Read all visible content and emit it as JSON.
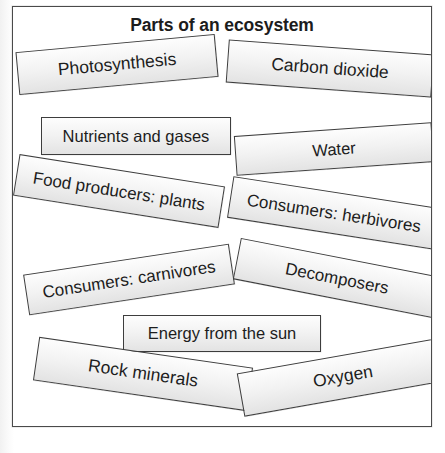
{
  "diagram": {
    "title": "Parts of an ecosystem",
    "type": "word-card-collage",
    "frame_border_color": "#4a4a4a",
    "card_fill_color": "#f0f0f0",
    "card_border_color": "#3d3d3d",
    "text_color": "#1d1d1d",
    "cards": [
      {
        "id": "photosynthesis",
        "label": "Photosynthesis",
        "rotation_deg": -5.2,
        "row": 1,
        "side": "left"
      },
      {
        "id": "carbon-dioxide",
        "label": "Carbon dioxide",
        "rotation_deg": 4.2,
        "row": 1,
        "side": "right"
      },
      {
        "id": "nutrients",
        "label": "Nutrients and gases",
        "rotation_deg": 0,
        "row": 2,
        "side": "left"
      },
      {
        "id": "water",
        "label": "Water",
        "rotation_deg": -4.0,
        "row": 2,
        "side": "right"
      },
      {
        "id": "food-producers",
        "label": "Food producers: plants",
        "rotation_deg": 9.0,
        "row": 3,
        "side": "left"
      },
      {
        "id": "herbivores",
        "label": "Consumers: herbivores",
        "rotation_deg": 8.8,
        "row": 3,
        "side": "right"
      },
      {
        "id": "carnivores",
        "label": "Consumers: carnivores",
        "rotation_deg": -8.6,
        "row": 4,
        "side": "left"
      },
      {
        "id": "decomposers",
        "label": "Decomposers",
        "rotation_deg": 11.0,
        "row": 4,
        "side": "right"
      },
      {
        "id": "energy-sun",
        "label": "Energy from the sun",
        "rotation_deg": 0,
        "row": 5,
        "side": "center"
      },
      {
        "id": "rock-minerals",
        "label": "Rock minerals",
        "rotation_deg": 8.2,
        "row": 6,
        "side": "left"
      },
      {
        "id": "oxygen",
        "label": "Oxygen",
        "rotation_deg": -10.0,
        "row": 6,
        "side": "right"
      }
    ]
  }
}
